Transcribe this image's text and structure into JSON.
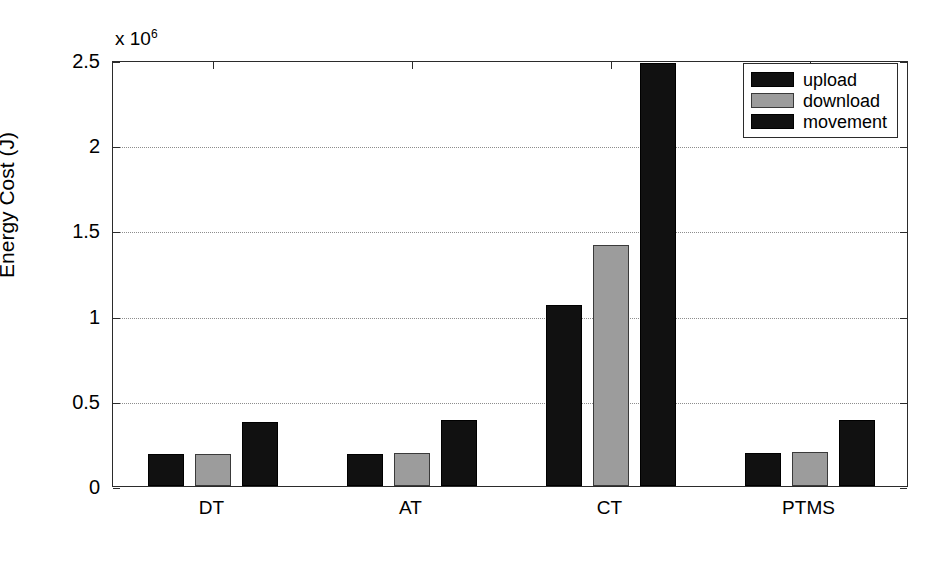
{
  "chart_data": {
    "type": "bar",
    "title": "",
    "xlabel": "Transmission Strategies",
    "ylabel": "Energy Cost (J)",
    "y_exponent_label": "x 10",
    "y_exponent_power": "6",
    "categories": [
      "DT",
      "AT",
      "CT",
      "PTMS"
    ],
    "series": [
      {
        "name": "upload",
        "values": [
          190000,
          190000,
          1060000,
          195000
        ]
      },
      {
        "name": "download",
        "values": [
          190000,
          195000,
          1415000,
          200000
        ]
      },
      {
        "name": "movement",
        "values": [
          375000,
          385000,
          2480000,
          390000
        ]
      }
    ],
    "ylim": [
      0,
      2500000
    ],
    "ytick_values": [
      0,
      500000,
      1000000,
      1500000,
      2000000,
      2500000
    ],
    "ytick_labels": [
      "0",
      "0.5",
      "1",
      "1.5",
      "2",
      "2.5"
    ],
    "grid": true,
    "grid_axis": "y",
    "legend_position": "top-right",
    "colors": {
      "upload": "#111111",
      "download": "#9c9c9c",
      "movement": "#111111",
      "axis": "#2b2b2b",
      "grid": "#8d8d8d",
      "background": "#ffffff"
    }
  },
  "legend": {
    "items": [
      {
        "label": "upload",
        "key": "upload"
      },
      {
        "label": "download",
        "key": "download"
      },
      {
        "label": "movement",
        "key": "movement"
      }
    ]
  }
}
